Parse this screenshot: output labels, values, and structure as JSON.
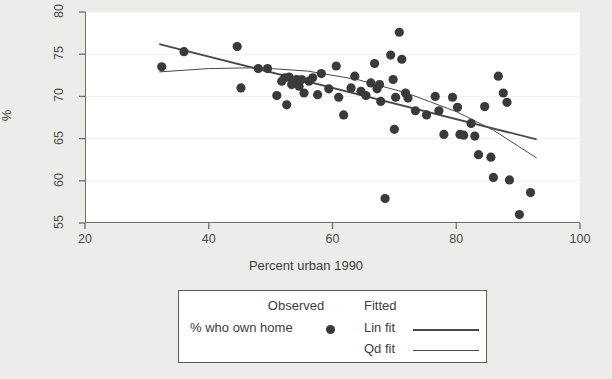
{
  "chart_data": {
    "type": "scatter",
    "title": "",
    "xlabel": "Percent urban 1990",
    "ylabel": "%",
    "xlim": [
      20,
      100
    ],
    "ylim": [
      55,
      80
    ],
    "xticks": [
      20,
      40,
      60,
      80,
      100
    ],
    "yticks": [
      55,
      60,
      65,
      70,
      75,
      80
    ],
    "grid": "horizontal-faint",
    "legend_position": "below-plot",
    "marker_color": "#3a3a3a",
    "line_color": "#4a4a4a",
    "series": [
      {
        "name": "% who own home",
        "type": "scatter",
        "points": [
          [
            32.4,
            73.5
          ],
          [
            36.0,
            75.3
          ],
          [
            44.6,
            75.9
          ],
          [
            45.2,
            71.0
          ],
          [
            48.0,
            73.3
          ],
          [
            49.5,
            73.3
          ],
          [
            51.0,
            70.1
          ],
          [
            51.8,
            71.8
          ],
          [
            52.3,
            72.2
          ],
          [
            52.6,
            69.0
          ],
          [
            53.0,
            72.3
          ],
          [
            53.4,
            71.4
          ],
          [
            54.2,
            72.0
          ],
          [
            54.6,
            71.2
          ],
          [
            55.0,
            72.0
          ],
          [
            55.4,
            70.4
          ],
          [
            56.2,
            71.8
          ],
          [
            56.8,
            72.2
          ],
          [
            57.6,
            70.2
          ],
          [
            58.2,
            72.7
          ],
          [
            59.4,
            70.9
          ],
          [
            60.6,
            73.6
          ],
          [
            61.0,
            69.9
          ],
          [
            61.8,
            67.8
          ],
          [
            63.0,
            71.0
          ],
          [
            63.6,
            72.4
          ],
          [
            64.6,
            70.6
          ],
          [
            65.4,
            70.1
          ],
          [
            66.2,
            71.6
          ],
          [
            66.8,
            73.9
          ],
          [
            67.2,
            70.9
          ],
          [
            67.6,
            71.4
          ],
          [
            67.8,
            69.4
          ],
          [
            68.5,
            57.9
          ],
          [
            69.4,
            74.9
          ],
          [
            69.8,
            72.0
          ],
          [
            70.0,
            66.1
          ],
          [
            70.2,
            69.9
          ],
          [
            70.8,
            77.6
          ],
          [
            71.2,
            74.4
          ],
          [
            71.8,
            70.4
          ],
          [
            72.2,
            69.8
          ],
          [
            73.4,
            68.3
          ],
          [
            75.2,
            67.8
          ],
          [
            76.6,
            70.0
          ],
          [
            77.2,
            68.3
          ],
          [
            78.0,
            65.5
          ],
          [
            79.4,
            69.9
          ],
          [
            80.2,
            68.7
          ],
          [
            80.6,
            65.5
          ],
          [
            81.2,
            65.4
          ],
          [
            82.4,
            66.8
          ],
          [
            83.0,
            65.3
          ],
          [
            83.6,
            63.1
          ],
          [
            84.6,
            68.8
          ],
          [
            85.6,
            62.8
          ],
          [
            86.0,
            60.4
          ],
          [
            86.8,
            72.4
          ],
          [
            87.6,
            70.4
          ],
          [
            88.2,
            69.3
          ],
          [
            88.6,
            60.1
          ],
          [
            90.2,
            56.0
          ],
          [
            92.0,
            58.6
          ]
        ]
      },
      {
        "name": "Lin fit",
        "type": "line",
        "width": 1.8,
        "points": [
          [
            32.0,
            76.2
          ],
          [
            93.0,
            64.9
          ]
        ]
      },
      {
        "name": "Qd fit",
        "type": "line",
        "width": 1.0,
        "points": [
          [
            32.0,
            72.9
          ],
          [
            40.0,
            73.3
          ],
          [
            48.0,
            73.4
          ],
          [
            56.0,
            73.0
          ],
          [
            64.0,
            72.0
          ],
          [
            72.0,
            70.4
          ],
          [
            80.0,
            68.2
          ],
          [
            86.0,
            66.0
          ],
          [
            93.0,
            62.7
          ]
        ]
      }
    ]
  },
  "axes": {
    "x_title": "Percent urban 1990",
    "y_title": "%",
    "x_ticks": [
      "20",
      "40",
      "60",
      "80",
      "100"
    ],
    "y_ticks": [
      "55",
      "60",
      "65",
      "70",
      "75",
      "80"
    ]
  },
  "legend": {
    "observed_header": "Observed",
    "fitted_header": "Fitted",
    "observed_label": "% who own home",
    "lin_fit_label": "Lin fit",
    "qd_fit_label": "Qd fit"
  }
}
